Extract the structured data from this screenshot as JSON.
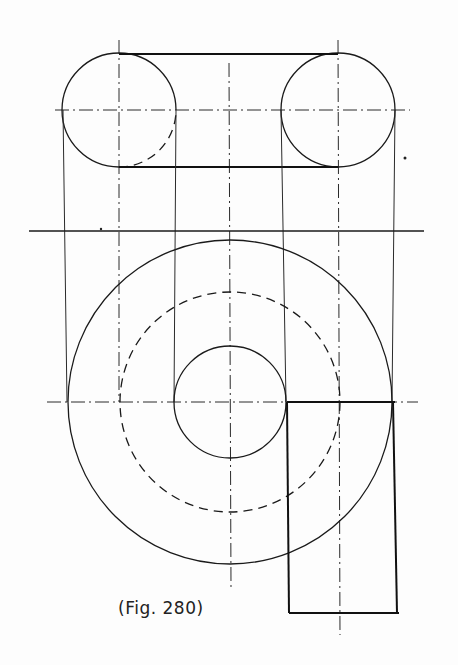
{
  "figure": {
    "caption": "(Fig. 280)",
    "type": "orthographic projection drawing",
    "colors": {
      "ink": "#1a1a1a",
      "paper": "#fdfdfd"
    }
  },
  "top_view": {
    "left_circle": {
      "cx": 119,
      "cy": 110,
      "r": 57,
      "hidden_quadrant": "lower-right"
    },
    "right_circle": {
      "cx": 338,
      "cy": 110,
      "r": 57
    },
    "tangent_top_y": 55,
    "tangent_bottom_y": 166,
    "horizontal_centerline_y": 110
  },
  "reference_line": {
    "y": 231,
    "x1": 29,
    "x2": 424
  },
  "front_view": {
    "center": {
      "cx": 230,
      "cy": 402
    },
    "outer_circle_r": 162,
    "hidden_circle_r": 110,
    "inner_circle_r": 56,
    "rectangle": {
      "x1": 287,
      "y1": 402,
      "x2": 395,
      "y2": 613
    },
    "horizontal_centerline_y": 402
  },
  "projector_lines_x": [
    63,
    119,
    176,
    229,
    282,
    339,
    394
  ]
}
